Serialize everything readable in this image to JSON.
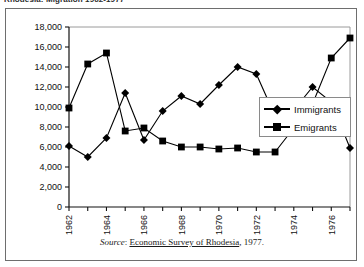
{
  "page": {
    "cut_title": "Rhodesia: Migration 1962-1977"
  },
  "source": {
    "prefix": "Source",
    "colon": ":",
    "publication": "Economic Survey of Rhodesia",
    "suffix": ", 1977."
  },
  "legend": {
    "position": "right-middle",
    "entries": [
      {
        "label": "Immigrants",
        "marker": "diamond",
        "color": "#000000"
      },
      {
        "label": "Emigrants",
        "marker": "square",
        "color": "#000000"
      }
    ]
  },
  "chart_data": {
    "type": "line",
    "title": "",
    "xlabel": "",
    "ylabel": "",
    "x": [
      1962,
      1963,
      1964,
      1965,
      1966,
      1967,
      1968,
      1969,
      1970,
      1971,
      1972,
      1973,
      1974,
      1975,
      1976,
      1977
    ],
    "tick_labels_x": [
      "1962",
      "",
      "1964",
      "",
      "1966",
      "",
      "1968",
      "",
      "1970",
      "",
      "1972",
      "",
      "1974",
      "",
      "1976",
      ""
    ],
    "ticks_y": [
      0,
      2000,
      4000,
      6000,
      8000,
      10000,
      12000,
      14000,
      16000,
      18000
    ],
    "tick_labels_y": [
      "0",
      "2,000",
      "4,000",
      "6,000",
      "8,000",
      "10,000",
      "12,000",
      "14,000",
      "16,000",
      "18,000"
    ],
    "ylim": [
      0,
      18000
    ],
    "xlim": [
      1962,
      1977
    ],
    "grid": false,
    "series": [
      {
        "name": "Immigrants",
        "marker": "diamond",
        "color": "#000000",
        "values": [
          6100,
          5000,
          6900,
          11400,
          6700,
          9600,
          11100,
          10300,
          12200,
          14000,
          13300,
          9100,
          9700,
          12000,
          10500,
          5900
        ]
      },
      {
        "name": "Emigrants",
        "marker": "square",
        "color": "#000000",
        "values": [
          9900,
          14300,
          15400,
          7600,
          7900,
          6600,
          6000,
          6000,
          5800,
          5900,
          5500,
          5500,
          7900,
          10300,
          14900,
          16900
        ]
      }
    ]
  }
}
